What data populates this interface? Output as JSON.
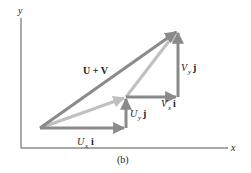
{
  "figure": {
    "caption": "(b)",
    "axes": {
      "x_label": "x",
      "y_label": "y"
    },
    "vectors": {
      "sum": {
        "label": "U + V",
        "color": "#8a8a8a"
      },
      "u": {
        "color": "#b8b8b8"
      },
      "ux": {
        "label_main": "U",
        "label_sub": "x",
        "label_unit": "i",
        "color": "#8a8a8a"
      },
      "uy": {
        "label_main": "U",
        "label_sub": "y",
        "label_unit": "j",
        "color": "#8a8a8a"
      },
      "vx": {
        "label_main": "V",
        "label_sub": "x",
        "label_unit": "i",
        "color": "#8a8a8a"
      },
      "vy": {
        "label_main": "V",
        "label_sub": "y",
        "label_unit": "j",
        "color": "#8a8a8a"
      },
      "v": {
        "color": "#b8b8b8"
      }
    },
    "colors": {
      "axis": "#555555",
      "dark_vector": "#8a8a8a",
      "light_vector": "#c0c0c0"
    }
  }
}
